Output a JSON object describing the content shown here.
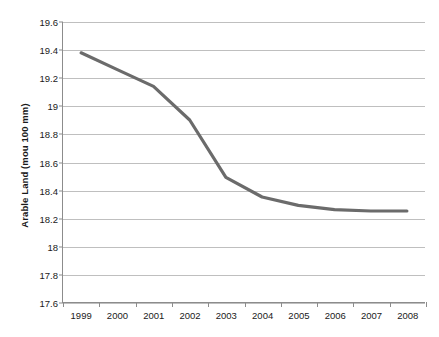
{
  "chart_data": {
    "type": "line",
    "title": "",
    "xlabel": "",
    "ylabel": "Arable Land (mou 100 mm)",
    "grid": true,
    "legend": "none",
    "line_color": "#6b6b6b",
    "grid_color": "#bfbfbf",
    "axis_color": "#8c8c8c",
    "categories": [
      "1999",
      "2000",
      "2001",
      "2002",
      "2003",
      "2004",
      "2005",
      "2006",
      "2007",
      "2008"
    ],
    "x": [
      1999,
      2000,
      2001,
      2002,
      2003,
      2004,
      2005,
      2006,
      2007,
      2008
    ],
    "values": [
      19.38,
      19.26,
      19.14,
      18.9,
      18.49,
      18.35,
      18.29,
      18.26,
      18.25,
      18.25
    ],
    "ylim": [
      17.6,
      19.6
    ],
    "ytick_labels": [
      "19.6",
      "19.4",
      "19.2",
      "19",
      "18.8",
      "18.6",
      "18.4",
      "18.2",
      "18",
      "17.8",
      "17.6"
    ],
    "ytick_values": [
      19.6,
      19.4,
      19.2,
      19.0,
      18.8,
      18.6,
      18.4,
      18.2,
      18.0,
      17.8,
      17.6
    ],
    "series": [
      {
        "name": "Arable Land",
        "values": [
          19.38,
          19.26,
          19.14,
          18.9,
          18.49,
          18.35,
          18.29,
          18.26,
          18.25,
          18.25
        ]
      }
    ]
  }
}
